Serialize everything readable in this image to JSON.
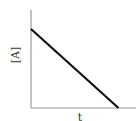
{
  "chart_data": {
    "type": "line",
    "title": "",
    "xlabel": "t",
    "ylabel": "[A]",
    "x": [
      0,
      1
    ],
    "series": [
      {
        "name": "[A]",
        "values": [
          1,
          0
        ]
      }
    ],
    "xlim": [
      0,
      1.2
    ],
    "ylim": [
      0,
      1.24
    ],
    "grid": false,
    "legend": null,
    "xticks": [],
    "yticks": [],
    "annotations": [],
    "style": {
      "line_color": "#111111",
      "axis_color": "#999999"
    }
  },
  "labels": {
    "y_axis": "[A]",
    "x_axis": "t"
  }
}
